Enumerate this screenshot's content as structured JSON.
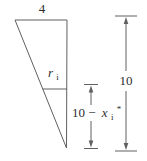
{
  "figure": {
    "colors": {
      "background": "#ffffff",
      "line": "#606060",
      "text": "#2e2e2e"
    },
    "labels": {
      "top_width": "4",
      "radius": {
        "base": "r",
        "sub": "i"
      },
      "depth": {
        "prefix": "10 −",
        "variable": "x",
        "sub": "i",
        "sup": "*"
      },
      "total_height": "10"
    }
  }
}
